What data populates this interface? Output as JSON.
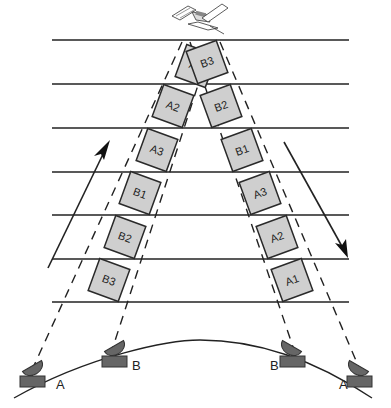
{
  "diagram": {
    "colors": {
      "line": "#222222",
      "box_fill": "#cfcfcf",
      "box_stroke": "#2a2a2a",
      "station_fill": "#666666"
    },
    "horizontal_lines_y": [
      40,
      84,
      128,
      172,
      215,
      259,
      302
    ],
    "left_column": {
      "direction": "uplink (up arrow)",
      "boxes": [
        {
          "label": "A1",
          "cx": 196,
          "cy": 66,
          "rot": 20
        },
        {
          "label": "A2",
          "cx": 173,
          "cy": 106,
          "rot": 20
        },
        {
          "label": "A3",
          "cx": 157,
          "cy": 150,
          "rot": 20
        },
        {
          "label": "B1",
          "cx": 140,
          "cy": 193,
          "rot": 20
        },
        {
          "label": "B2",
          "cx": 125,
          "cy": 237,
          "rot": 20
        },
        {
          "label": "B3",
          "cx": 109,
          "cy": 280,
          "rot": 20
        }
      ]
    },
    "right_column": {
      "direction": "downlink (down arrow)",
      "boxes": [
        {
          "label": "B3",
          "cx": 207,
          "cy": 62,
          "rot": -20
        },
        {
          "label": "B2",
          "cx": 221,
          "cy": 106,
          "rot": -20
        },
        {
          "label": "B1",
          "cx": 242,
          "cy": 150,
          "rot": -20
        },
        {
          "label": "A3",
          "cx": 260,
          "cy": 193,
          "rot": -20
        },
        {
          "label": "A2",
          "cx": 277,
          "cy": 237,
          "rot": -20
        },
        {
          "label": "A1",
          "cx": 292,
          "cy": 280,
          "rot": -20
        }
      ]
    },
    "stations": [
      {
        "label": "A",
        "x": 32,
        "y": 382,
        "label_x": 56,
        "label_y": 389
      },
      {
        "label": "B",
        "x": 114,
        "y": 362,
        "label_x": 132,
        "label_y": 370
      },
      {
        "label": "B",
        "x": 292,
        "y": 362,
        "label_x": 270,
        "label_y": 370
      },
      {
        "label": "A",
        "x": 359,
        "y": 382,
        "label_x": 339,
        "label_y": 389
      }
    ]
  }
}
